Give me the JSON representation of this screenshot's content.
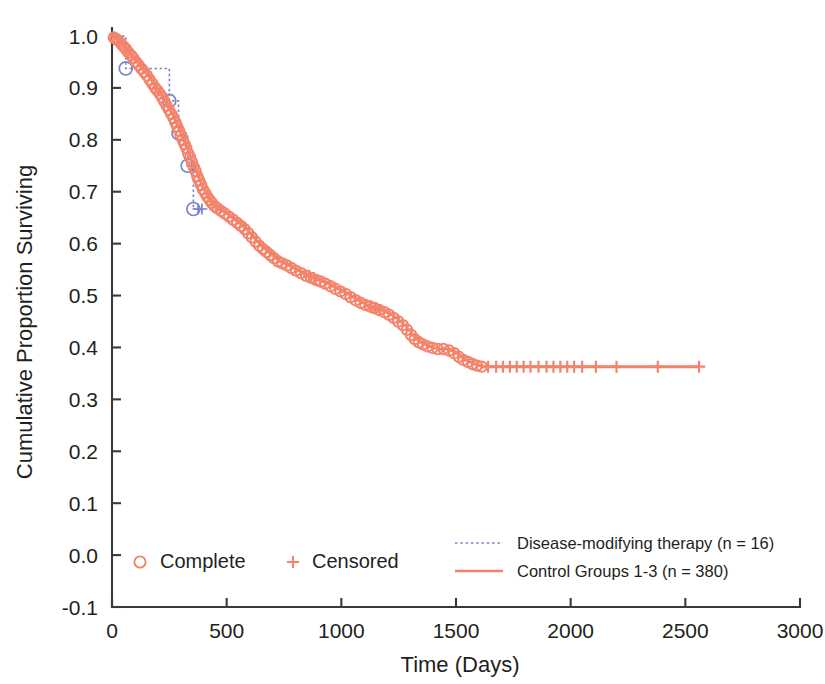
{
  "chart_data": {
    "type": "line",
    "title": "",
    "subtitle": "",
    "xlabel": "Time (Days)",
    "ylabel": "Cumulative Proportion Surviving",
    "xlim": [
      0,
      3000
    ],
    "ylim": [
      -0.1,
      1.0
    ],
    "xticks": [
      0,
      500,
      1000,
      1500,
      2000,
      2500,
      3000
    ],
    "xtick_labels": [
      "0",
      "500",
      "1000",
      "1500",
      "2000",
      "2500",
      "3000"
    ],
    "yticks": [
      -0.1,
      0.0,
      0.1,
      0.2,
      0.3,
      0.4,
      0.5,
      0.6,
      0.7,
      0.8,
      0.9,
      1.0
    ],
    "ytick_labels": [
      "-0.1",
      "0.0",
      "0.1",
      "0.2",
      "0.3",
      "0.4",
      "0.5",
      "0.6",
      "0.7",
      "0.8",
      "0.9",
      "1.0"
    ],
    "grid": false,
    "legend_position": "bottom",
    "colors": {
      "control": "#F4836B",
      "therapy": "#7C85C8",
      "axis": "#3a3a3a",
      "text": "#231f20",
      "background": "#ffffff"
    },
    "series": [
      {
        "name": "Disease-modifying therapy (n = 16)",
        "n": 16,
        "style": "dotted",
        "color": "#7C85C8",
        "marker": "circle",
        "steps": [
          [
            0,
            1.0
          ],
          [
            60,
            1.0
          ],
          [
            60,
            0.9375
          ],
          [
            250,
            0.9375
          ],
          [
            250,
            0.875
          ],
          [
            290,
            0.875
          ],
          [
            290,
            0.8125
          ],
          [
            330,
            0.8125
          ],
          [
            330,
            0.75
          ],
          [
            355,
            0.75
          ],
          [
            355,
            0.6667
          ],
          [
            385,
            0.6667
          ]
        ],
        "complete_points": [
          [
            60,
            0.9375
          ],
          [
            250,
            0.875
          ],
          [
            290,
            0.8125
          ],
          [
            330,
            0.75
          ],
          [
            355,
            0.6667
          ]
        ],
        "censored_points": [
          [
            348,
            0.75
          ],
          [
            375,
            0.6667
          ],
          [
            392,
            0.6667
          ]
        ]
      },
      {
        "name": "Control Groups 1-3 (n = 380)",
        "n": 380,
        "style": "solid",
        "color": "#F4836B",
        "marker": "circle",
        "steps": [
          [
            0,
            1.0
          ],
          [
            8,
            0.997
          ],
          [
            16,
            0.995
          ],
          [
            24,
            0.992
          ],
          [
            32,
            0.989
          ],
          [
            42,
            0.984
          ],
          [
            52,
            0.979
          ],
          [
            62,
            0.974
          ],
          [
            72,
            0.968
          ],
          [
            82,
            0.963
          ],
          [
            92,
            0.958
          ],
          [
            104,
            0.95
          ],
          [
            116,
            0.944
          ],
          [
            128,
            0.937
          ],
          [
            140,
            0.931
          ],
          [
            152,
            0.924
          ],
          [
            164,
            0.916
          ],
          [
            176,
            0.908
          ],
          [
            188,
            0.9
          ],
          [
            198,
            0.895
          ],
          [
            208,
            0.889
          ],
          [
            218,
            0.882
          ],
          [
            228,
            0.874
          ],
          [
            238,
            0.866
          ],
          [
            248,
            0.858
          ],
          [
            258,
            0.85
          ],
          [
            268,
            0.842
          ],
          [
            276,
            0.834
          ],
          [
            284,
            0.826
          ],
          [
            292,
            0.818
          ],
          [
            300,
            0.808
          ],
          [
            308,
            0.8
          ],
          [
            316,
            0.792
          ],
          [
            324,
            0.784
          ],
          [
            332,
            0.774
          ],
          [
            340,
            0.766
          ],
          [
            348,
            0.758
          ],
          [
            356,
            0.748
          ],
          [
            364,
            0.74
          ],
          [
            372,
            0.73
          ],
          [
            380,
            0.722
          ],
          [
            388,
            0.713
          ],
          [
            396,
            0.705
          ],
          [
            406,
            0.698
          ],
          [
            416,
            0.69
          ],
          [
            426,
            0.684
          ],
          [
            436,
            0.678
          ],
          [
            448,
            0.672
          ],
          [
            460,
            0.668
          ],
          [
            475,
            0.663
          ],
          [
            492,
            0.658
          ],
          [
            510,
            0.652
          ],
          [
            528,
            0.646
          ],
          [
            546,
            0.64
          ],
          [
            562,
            0.634
          ],
          [
            578,
            0.628
          ],
          [
            594,
            0.62
          ],
          [
            610,
            0.612
          ],
          [
            626,
            0.604
          ],
          [
            642,
            0.596
          ],
          [
            658,
            0.59
          ],
          [
            674,
            0.584
          ],
          [
            690,
            0.578
          ],
          [
            706,
            0.572
          ],
          [
            724,
            0.566
          ],
          [
            742,
            0.562
          ],
          [
            762,
            0.558
          ],
          [
            782,
            0.553
          ],
          [
            802,
            0.548
          ],
          [
            824,
            0.543
          ],
          [
            846,
            0.538
          ],
          [
            868,
            0.534
          ],
          [
            890,
            0.53
          ],
          [
            910,
            0.527
          ],
          [
            930,
            0.523
          ],
          [
            952,
            0.518
          ],
          [
            974,
            0.513
          ],
          [
            996,
            0.508
          ],
          [
            1018,
            0.503
          ],
          [
            1040,
            0.497
          ],
          [
            1062,
            0.491
          ],
          [
            1084,
            0.486
          ],
          [
            1104,
            0.482
          ],
          [
            1124,
            0.479
          ],
          [
            1144,
            0.476
          ],
          [
            1166,
            0.472
          ],
          [
            1188,
            0.468
          ],
          [
            1208,
            0.463
          ],
          [
            1228,
            0.457
          ],
          [
            1248,
            0.45
          ],
          [
            1268,
            0.443
          ],
          [
            1286,
            0.434
          ],
          [
            1304,
            0.424
          ],
          [
            1320,
            0.416
          ],
          [
            1338,
            0.41
          ],
          [
            1356,
            0.406
          ],
          [
            1376,
            0.402
          ],
          [
            1398,
            0.399
          ],
          [
            1420,
            0.397
          ],
          [
            1446,
            0.397
          ],
          [
            1470,
            0.394
          ],
          [
            1492,
            0.389
          ],
          [
            1512,
            0.382
          ],
          [
            1532,
            0.376
          ],
          [
            1552,
            0.372
          ],
          [
            1572,
            0.368
          ],
          [
            1592,
            0.365
          ],
          [
            1612,
            0.363
          ],
          [
            1640,
            0.363
          ],
          [
            2560,
            0.363
          ]
        ],
        "censored_times": [
          860,
          880,
          1130,
          1150,
          1170,
          1640,
          1675,
          1705,
          1735,
          1765,
          1795,
          1825,
          1860,
          1895,
          1925,
          1955,
          1985,
          2015,
          2050,
          2110,
          2200,
          2380,
          2560
        ],
        "plateau_value": 0.363,
        "plateau_start": 1640,
        "plateau_end": 2560
      }
    ],
    "legend": [
      {
        "key": "complete",
        "label": "Complete",
        "marker": "circle",
        "color": "#F4836B"
      },
      {
        "key": "censored",
        "label": "Censored",
        "marker": "plus",
        "color": "#F4836B"
      },
      {
        "key": "therapy",
        "label": "Disease-modifying therapy (n = 16)",
        "marker": "dotted-line",
        "color": "#7C85C8"
      },
      {
        "key": "control",
        "label": "Control Groups 1-3 (n = 380)",
        "marker": "solid-line",
        "color": "#F4836B"
      }
    ]
  }
}
